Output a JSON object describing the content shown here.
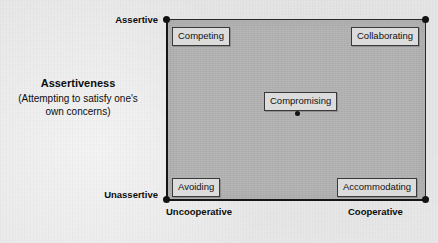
{
  "diagram": {
    "type": "two-axis-grid"
  },
  "axes": {
    "vertical": {
      "name": "Assertiveness",
      "description": "(Attempting to satisfy one's own concerns)",
      "high_label": "Assertive",
      "low_label": "Unassertive"
    },
    "horizontal": {
      "low_label": "Uncooperative",
      "high_label": "Cooperative"
    }
  },
  "modes": [
    {
      "label": "Competing",
      "position": "top-left"
    },
    {
      "label": "Collaborating",
      "position": "top-right"
    },
    {
      "label": "Compromising",
      "position": "center"
    },
    {
      "label": "Avoiding",
      "position": "bottom-left"
    },
    {
      "label": "Accommodating",
      "position": "bottom-right"
    }
  ],
  "colors": {
    "page_background": "#e8e8e8",
    "plot_fill": "#b2b2b2",
    "axis": "#151515",
    "box_fill": "#dcdcdc",
    "box_border": "#3a3a3a",
    "text": "#0d0d0d"
  }
}
